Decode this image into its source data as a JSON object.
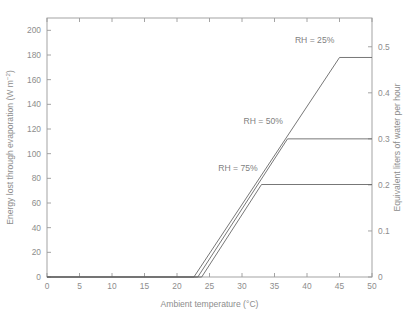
{
  "chart_data": {
    "type": "line",
    "title": "",
    "xlabel": "Ambient temperature (°C)",
    "ylabel": "Energy lost through evaporation (W m−2)",
    "ylabel_left_main": "Energy lost through evaporation (W m",
    "ylabel_left_sup": "−2",
    "ylabel_left_tail": ")",
    "ylabel_right": "Equivalent liters of water per hour",
    "xlim": [
      0,
      50
    ],
    "ylim_left": [
      0,
      210
    ],
    "ylim_right": [
      0,
      0.5625
    ],
    "grid": false,
    "legend_position": "inline-right-of-curves",
    "xticks": [
      0,
      5,
      10,
      15,
      20,
      25,
      30,
      35,
      40,
      45,
      50
    ],
    "xticklabels": [
      "0",
      "5",
      "10",
      "15",
      "20",
      "25",
      "30",
      "35",
      "40",
      "45",
      "50"
    ],
    "yticks_left": [
      0,
      20,
      40,
      60,
      80,
      100,
      120,
      140,
      160,
      180,
      200
    ],
    "yticklabels_left": [
      "0",
      "20",
      "40",
      "60",
      "80",
      "100",
      "120",
      "140",
      "160",
      "180",
      "200"
    ],
    "yticks_right": [
      0,
      0.1,
      0.2,
      0.3,
      0.4,
      0.5
    ],
    "yticklabels_right": [
      "0",
      "0.1",
      "0.2",
      "0.3",
      "0.4",
      "0.5"
    ],
    "right_axis_scale_factor": 0.00267857,
    "series": [
      {
        "name": "RH = 25%",
        "annotation": "RH = 25%",
        "annotation_x": 44.2,
        "annotation_y": 190,
        "color": "#5f5f5f",
        "onset_temp_c": 22.6,
        "plateau_temp_c": 45.0,
        "plateau_value_wm2": 178,
        "plateau_value_liters_per_hour": 0.477,
        "x": [
          0,
          22.6,
          45.0,
          50
        ],
        "y": [
          0,
          0,
          178,
          178
        ]
      },
      {
        "name": "RH = 50%",
        "annotation": "RH = 50%",
        "annotation_y": 124,
        "annotation_x": 36.3,
        "color": "#5f5f5f",
        "onset_temp_c": 23.2,
        "plateau_temp_c": 37.0,
        "plateau_value_wm2": 112,
        "plateau_value_liters_per_hour": 0.3,
        "x": [
          0,
          23.2,
          37.0,
          50
        ],
        "y": [
          0,
          0,
          112,
          112
        ]
      },
      {
        "name": "RH = 75%",
        "annotation": "RH = 75%",
        "annotation_x": 32.4,
        "annotation_y": 86,
        "color": "#5f5f5f",
        "onset_temp_c": 23.8,
        "plateau_temp_c": 33.0,
        "plateau_value_wm2": 75,
        "plateau_value_liters_per_hour": 0.2,
        "x": [
          0,
          23.8,
          33.0,
          50
        ],
        "y": [
          0,
          0,
          75,
          75
        ]
      }
    ]
  },
  "figure": {
    "background_color": "#ffffff",
    "axis_color": "#9a9a9a",
    "text_color": "#8d8d8d",
    "line_color": "#5f5f5f"
  }
}
